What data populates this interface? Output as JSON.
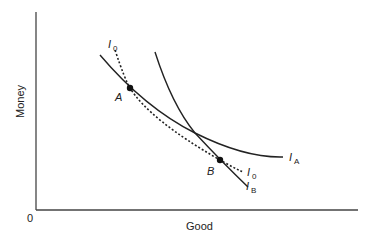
{
  "diagram": {
    "title": "",
    "axes": {
      "x_label": "Good",
      "y_label": "Money",
      "origin_label": "0"
    },
    "curves": [
      {
        "id": "IA",
        "label_main": "I",
        "label_sub": "A",
        "style": "solid"
      },
      {
        "id": "IB",
        "label_main": "I",
        "label_sub": "B",
        "style": "solid"
      },
      {
        "id": "I0",
        "label_main": "I",
        "label_sub": "0",
        "style": "dotted"
      }
    ],
    "points": [
      {
        "id": "A",
        "label": "A"
      },
      {
        "id": "B",
        "label": "B"
      }
    ],
    "colors": {
      "line": "#222222",
      "background": "#ffffff"
    }
  }
}
